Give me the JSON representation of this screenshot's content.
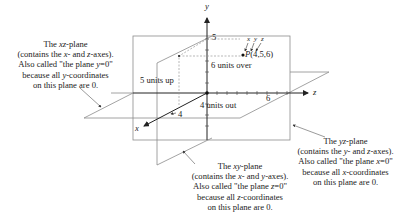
{
  "figure": {
    "axes": {
      "x": "x",
      "y": "y",
      "z": "z"
    },
    "tick_labels": {
      "y": "5",
      "x": "4",
      "z": "6"
    },
    "point": {
      "label": "P(4,5,6)",
      "coordinate_labels": [
        "x",
        "y",
        "z"
      ],
      "x": 4,
      "y": 5,
      "z": 6
    },
    "path_labels": {
      "up": "5 units up",
      "over": "6 units over",
      "out": "4 units out"
    },
    "callouts": {
      "xz_plane": {
        "lines": [
          "The xz-plane",
          "(contains the x- and z-axes).",
          "Also called \"the plane y=0\"",
          "because all y-coordinates",
          "on this plane are 0."
        ]
      },
      "yz_plane": {
        "lines": [
          "The yz-plane",
          "(contains the y- and z-axes).",
          "Also called \"the plane x=0\"",
          "because all x-coordinates",
          "on this plane are 0."
        ]
      },
      "xy_plane": {
        "lines": [
          "The xy-plane",
          "(contains the x- and y-axes).",
          "Also called \"the plane z=0\"",
          "because all z-coordinates",
          "on this plane are 0."
        ]
      }
    },
    "colors": {
      "plane_edge": "#8c8c8c",
      "axis": "#222222",
      "dashed": "#9a9a9a"
    }
  }
}
